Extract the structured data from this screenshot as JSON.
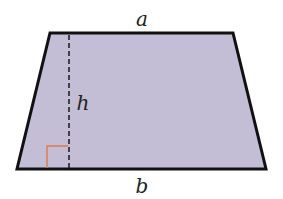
{
  "figure": {
    "shape": "trapezoid",
    "fill_color": "#c4bdd6",
    "stroke_color": "#111111",
    "height_line_color": "#222222",
    "right_angle_color": "#e07a4a",
    "vertices": {
      "top_left": [
        50,
        33
      ],
      "top_right": [
        233,
        33
      ],
      "bottom_right": [
        266,
        169
      ],
      "bottom_left": [
        17,
        169
      ]
    },
    "height_line": {
      "x": 69,
      "y1": 33,
      "y2": 169
    },
    "labels": {
      "top_base": "a",
      "bottom_base": "b",
      "height": "h"
    }
  }
}
